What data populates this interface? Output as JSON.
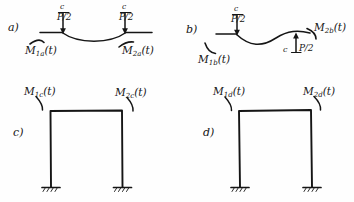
{
  "figure": {
    "ink_color": "#151515",
    "paper_color": "#fefefe"
  },
  "panels": [
    {
      "id": "a",
      "tag": "a)",
      "type": "beam-symmetric",
      "curve": "sagging-symmetric",
      "loads": [
        {
          "name": "load-left",
          "magnitude": "P/2",
          "marker": "c",
          "direction": "down"
        },
        {
          "name": "load-right",
          "magnitude": "P/2",
          "marker": "c",
          "direction": "down"
        }
      ],
      "moments": [
        {
          "name": "moment-left",
          "symbol": "M",
          "sub": "1a",
          "arg": "(t)",
          "text": "M1a(t)"
        },
        {
          "name": "moment-right",
          "symbol": "M",
          "sub": "2a",
          "arg": "(t)",
          "text": "M2a(t)"
        }
      ]
    },
    {
      "id": "b",
      "tag": "b)",
      "type": "beam-antisymmetric",
      "curve": "s-shaped-antisymmetric",
      "loads": [
        {
          "name": "load-left",
          "magnitude": "P/2",
          "marker": "c",
          "direction": "down"
        },
        {
          "name": "load-right",
          "magnitude": "P/2",
          "marker": "c",
          "direction": "up"
        }
      ],
      "moments": [
        {
          "name": "moment-left",
          "symbol": "M",
          "sub": "1b",
          "arg": "(t)",
          "text": "M1b(t)"
        },
        {
          "name": "moment-right",
          "symbol": "M",
          "sub": "2b",
          "arg": "(t)",
          "text": "M2b(t)"
        }
      ]
    },
    {
      "id": "c",
      "tag": "c)",
      "type": "portal-frame",
      "supports": "fixed-both",
      "deformation": "upright",
      "moments": [
        {
          "name": "moment-left",
          "symbol": "M",
          "sub": "1c",
          "arg": "(t)",
          "text": "M1c(t)"
        },
        {
          "name": "moment-right",
          "symbol": "M",
          "sub": "2c",
          "arg": "(t)",
          "text": "M2c(t)"
        }
      ]
    },
    {
      "id": "d",
      "tag": "d)",
      "type": "portal-frame",
      "supports": "fixed-both",
      "deformation": "sway",
      "moments": [
        {
          "name": "moment-left",
          "symbol": "M",
          "sub": "1d",
          "arg": "(t)",
          "text": "M1d(t)"
        },
        {
          "name": "moment-right",
          "symbol": "M",
          "sub": "2d",
          "arg": "(t)",
          "text": "M2d(t)"
        }
      ]
    }
  ]
}
